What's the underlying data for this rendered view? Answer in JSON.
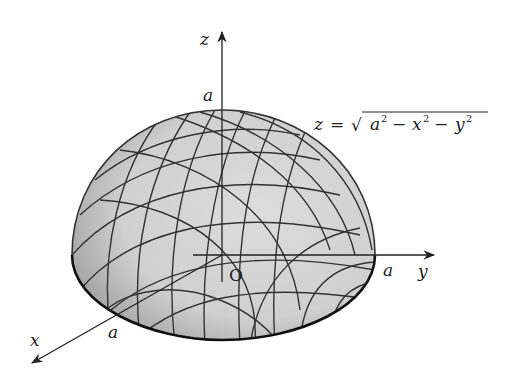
{
  "figure": {
    "equation": {
      "lhs": "z",
      "eq": "=",
      "sqrt": "√",
      "a": "a",
      "x": "x",
      "y": "y",
      "sup": "2",
      "minus": "−"
    },
    "axes": {
      "x": {
        "label": "x",
        "tick_label": "a"
      },
      "y": {
        "label": "y",
        "tick_label": "a"
      },
      "z": {
        "label": "z",
        "tick_label": "a"
      },
      "origin_label": "O"
    },
    "colors": {
      "surface_fill": "#d4d4d4",
      "surface_shade": "#a8a8a8",
      "grid_line": "#333333",
      "axis_line": "#222222",
      "background": "#ffffff"
    }
  }
}
